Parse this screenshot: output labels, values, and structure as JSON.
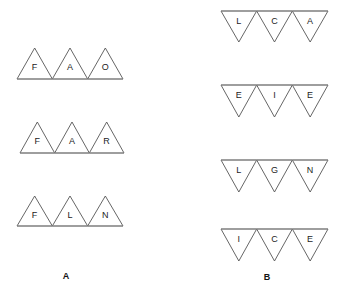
{
  "figure": {
    "background_color": "#ffffff",
    "stroke_color": "#555555",
    "rule_color": "#8a8a8a",
    "text_color": "#1c1c1c",
    "width": 350,
    "height": 295
  },
  "panels": [
    {
      "id": "A",
      "caption": "A",
      "caption_x": 66,
      "caption_y": 277,
      "orientation": "up",
      "rows": [
        {
          "id": "a-row-1",
          "letters": [
            "F",
            "A",
            "O"
          ],
          "x_left": 17,
          "x_right": 123,
          "apex_y": 48,
          "base_y": 79
        },
        {
          "id": "a-row-2",
          "letters": [
            "F",
            "A",
            "R"
          ],
          "x_left": 20,
          "x_right": 124,
          "apex_y": 122,
          "base_y": 153
        },
        {
          "id": "a-row-3",
          "letters": [
            "F",
            "L",
            "N"
          ],
          "x_left": 17,
          "x_right": 123,
          "apex_y": 196,
          "base_y": 226
        }
      ]
    },
    {
      "id": "B",
      "caption": "B",
      "caption_x": 267,
      "caption_y": 278,
      "orientation": "down",
      "rows": [
        {
          "id": "b-row-1",
          "letters": [
            "L",
            "C",
            "A"
          ],
          "x_left": 221,
          "x_right": 328,
          "top_y": 11,
          "apex_y": 42
        },
        {
          "id": "b-row-2",
          "letters": [
            "E",
            "I",
            "E"
          ],
          "x_left": 221,
          "x_right": 328,
          "top_y": 85,
          "apex_y": 117
        },
        {
          "id": "b-row-3",
          "letters": [
            "L",
            "G",
            "N"
          ],
          "x_left": 221,
          "x_right": 328,
          "top_y": 160,
          "apex_y": 192
        },
        {
          "id": "b-row-4",
          "letters": [
            "I",
            "C",
            "E"
          ],
          "x_left": 221,
          "x_right": 328,
          "top_y": 229,
          "apex_y": 261
        }
      ]
    }
  ]
}
